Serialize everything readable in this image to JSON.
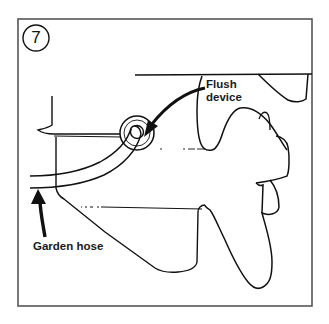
{
  "figure": {
    "step_number": "7",
    "labels": {
      "flush_device_line1": "Flush",
      "flush_device_line2": "device",
      "garden_hose": "Garden hose"
    },
    "colors": {
      "ink": "#111111",
      "frame": "#555555",
      "background": "#ffffff"
    }
  }
}
